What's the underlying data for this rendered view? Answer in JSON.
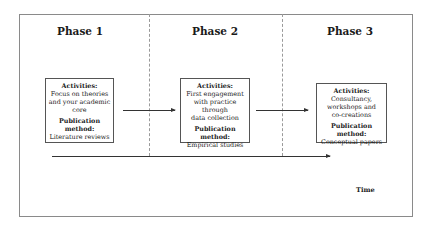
{
  "phases": [
    {
      "title": "Phase 1",
      "activities_label": "Activities:",
      "activities_lines": [
        "Focus on theories",
        "and your academic",
        "core"
      ],
      "publication_label": "Publication method:",
      "publication_value": "Literature reviews"
    },
    {
      "title": "Phase 2",
      "activities_label": "Activities:",
      "activities_lines": [
        "First engagement",
        "with practice through",
        "data collection"
      ],
      "publication_label": "Publication method:",
      "publication_value": "Empirical studies"
    },
    {
      "title": "Phase 3",
      "activities_label": "Activities:",
      "activities_lines": [
        "Consultancy,",
        "workshops and",
        "co-creations"
      ],
      "publication_label": "Publication method:",
      "publication_value": "Conceptual papers"
    }
  ],
  "axis": {
    "label": "Time"
  },
  "colors": {
    "frame": "#8a8a8a",
    "text": "#1a1a1a",
    "arrow": "#333333"
  }
}
